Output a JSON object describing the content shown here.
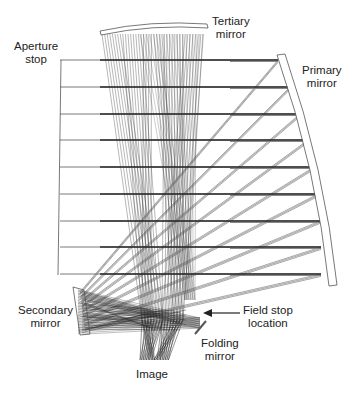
{
  "diagram": {
    "colors": {
      "ray": "#2a2a2a",
      "ray_light": "#666666",
      "mirror": "#444444",
      "background": "#ffffff"
    },
    "labels": {
      "aperture_stop": {
        "line1": "Aperture",
        "line2": "stop"
      },
      "tertiary_mirror": {
        "line1": "Tertiary",
        "line2": "mirror"
      },
      "primary_mirror": {
        "line1": "Primary",
        "line2": "mirror"
      },
      "secondary_mirror": {
        "line1": "Secondary",
        "line2": "mirror"
      },
      "field_stop": {
        "line1": "Field stop",
        "line2": "location"
      },
      "folding_mirror": {
        "line1": "Folding",
        "line2": "mirror"
      },
      "image": {
        "line1": "Image"
      }
    },
    "beams_y": [
      60,
      87,
      114,
      140,
      167,
      194,
      221,
      247,
      274
    ],
    "primary_hits_x": [
      278,
      290,
      300,
      308,
      314,
      318,
      320,
      321,
      321
    ],
    "aperture_stop_x": 60
  }
}
